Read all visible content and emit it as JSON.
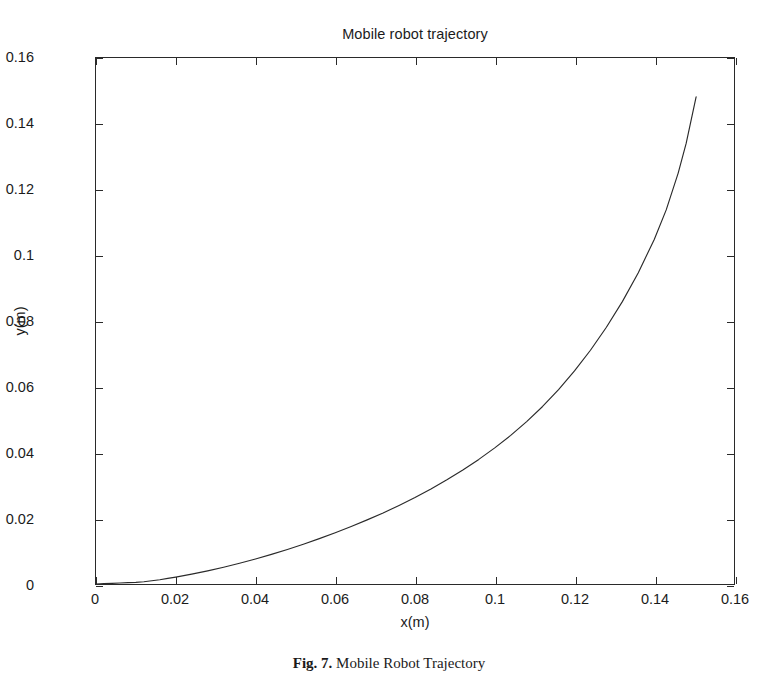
{
  "figure": {
    "caption_label": "Fig. 7.",
    "caption_text": "Mobile Robot Trajectory"
  },
  "chart_data": {
    "type": "line",
    "title": "Mobile robot trajectory",
    "xlabel": "x(m)",
    "ylabel": "y(m)",
    "xlim": [
      0,
      0.16
    ],
    "ylim": [
      0,
      0.16
    ],
    "grid": false,
    "legend": null,
    "line_color": "#2a2a2a",
    "background": "#ffffff",
    "xticks": [
      0,
      0.02,
      0.04,
      0.06,
      0.08,
      0.1,
      0.12,
      0.14,
      0.16
    ],
    "xticklabels": [
      "0",
      "0.02",
      "0.04",
      "0.06",
      "0.08",
      "0.1",
      "0.12",
      "0.14",
      "0.16"
    ],
    "yticks": [
      0,
      0.02,
      0.04,
      0.06,
      0.08,
      0.1,
      0.12,
      0.14,
      0.16
    ],
    "yticklabels": [
      "0",
      "0.02",
      "0.04",
      "0.06",
      "0.08",
      "0.1",
      "0.12",
      "0.14",
      "0.16"
    ],
    "series": [
      {
        "name": "trajectory",
        "x": [
          0.0,
          0.002,
          0.004,
          0.006,
          0.008,
          0.01,
          0.012,
          0.014,
          0.016,
          0.018,
          0.02,
          0.024,
          0.028,
          0.032,
          0.036,
          0.04,
          0.044,
          0.048,
          0.052,
          0.056,
          0.06,
          0.064,
          0.068,
          0.072,
          0.076,
          0.08,
          0.084,
          0.088,
          0.092,
          0.096,
          0.1,
          0.104,
          0.108,
          0.112,
          0.116,
          0.12,
          0.124,
          0.128,
          0.132,
          0.136,
          0.14,
          0.143,
          0.146,
          0.148,
          0.1505
        ],
        "y": [
          0.0,
          0.0001,
          0.0002,
          0.0003,
          0.0004,
          0.0005,
          0.0007,
          0.001,
          0.0013,
          0.0017,
          0.0021,
          0.003,
          0.004,
          0.0051,
          0.0063,
          0.0076,
          0.009,
          0.0105,
          0.0121,
          0.0138,
          0.0156,
          0.0175,
          0.0195,
          0.0216,
          0.0239,
          0.0263,
          0.0289,
          0.0317,
          0.0347,
          0.0379,
          0.0414,
          0.0452,
          0.0494,
          0.054,
          0.0591,
          0.0648,
          0.0711,
          0.0781,
          0.0859,
          0.0947,
          0.1048,
          0.1138,
          0.125,
          0.134,
          0.1482
        ],
        "endpoint": [
          0.1505,
          0.1482
        ],
        "start_point": [
          0.0,
          0.0
        ]
      }
    ]
  }
}
